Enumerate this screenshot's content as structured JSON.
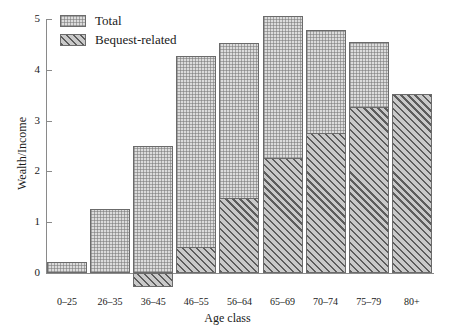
{
  "chart_data": {
    "type": "bar",
    "title": "",
    "xlabel": "Age class",
    "ylabel": "Wealth/Income",
    "categories": [
      "0–25",
      "26–35",
      "36–45",
      "46–55",
      "56–64",
      "65–69",
      "70–74",
      "75–79",
      "80+"
    ],
    "series": [
      {
        "name": "Total",
        "values": [
          0.22,
          1.26,
          2.5,
          4.27,
          4.53,
          5.06,
          4.78,
          4.55,
          3.52
        ]
      },
      {
        "name": "Bequest-related",
        "values": [
          0.0,
          0.0,
          -0.28,
          0.52,
          1.48,
          2.27,
          2.76,
          3.27,
          3.52
        ]
      }
    ],
    "ylim": [
      -0.5,
      5
    ],
    "yticks": [
      0,
      1,
      2,
      3,
      4,
      5
    ],
    "ytick_labels": [
      "0",
      "1",
      "2",
      "3",
      "4",
      "5"
    ],
    "grid": false,
    "legend_position": "top-left",
    "stacking": "overlay"
  },
  "legend": {
    "items": [
      {
        "label": "Total",
        "pattern": "dotted-fill",
        "color": "#dcdcdc"
      },
      {
        "label": "Bequest-related",
        "pattern": "diagonal-hatch",
        "color": "#c9c9c9"
      }
    ]
  },
  "axes": {
    "y_title": "Wealth/Income",
    "x_title": "Age class"
  }
}
